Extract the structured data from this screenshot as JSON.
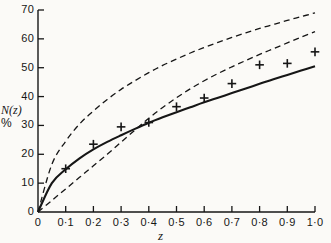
{
  "chart_data": {
    "type": "line",
    "title": "",
    "subtitle": "",
    "xlabel": "z",
    "ylabel": "N(z) %",
    "ylabel_lines": [
      "N(z)",
      "%"
    ],
    "xlim": [
      0,
      1.0
    ],
    "ylim": [
      0,
      70
    ],
    "grid": false,
    "legend": "none",
    "background_color": "#fbfaf7",
    "axis_color": "#161616",
    "x_ticks": [
      0,
      0.1,
      0.2,
      0.3,
      0.4,
      0.5,
      0.6,
      0.7,
      0.8,
      0.9,
      1.0
    ],
    "x_tick_labels": [
      "0",
      "0·1",
      "0·2",
      "0·3",
      "0·4",
      "0·5",
      "0·6",
      "0·7",
      "0·8",
      "0·9",
      "1·0"
    ],
    "y_ticks": [
      0,
      10,
      20,
      30,
      40,
      50,
      60,
      70
    ],
    "y_tick_labels": [
      "0",
      "10",
      "20",
      "30",
      "40",
      "50",
      "60",
      "70"
    ],
    "series": [
      {
        "name": "upper-dashed-curve",
        "style": "dashed",
        "color": "#161616",
        "x": [
          0,
          0.05,
          0.1,
          0.15,
          0.2,
          0.25,
          0.3,
          0.35,
          0.4,
          0.45,
          0.5,
          0.55,
          0.6,
          0.65,
          0.7,
          0.75,
          0.8,
          0.85,
          0.9,
          0.95,
          1.0
        ],
        "values": [
          0,
          16.5,
          24.5,
          30.5,
          35.0,
          39.0,
          42.5,
          45.5,
          48.3,
          50.8,
          53.0,
          55.1,
          57.0,
          58.8,
          60.5,
          62.1,
          63.6,
          65.0,
          66.4,
          67.7,
          69.0
        ]
      },
      {
        "name": "lower-dashed-curve",
        "style": "dashed",
        "color": "#161616",
        "x": [
          0,
          0.05,
          0.1,
          0.15,
          0.2,
          0.25,
          0.3,
          0.35,
          0.4,
          0.45,
          0.5,
          0.55,
          0.6,
          0.65,
          0.7,
          0.75,
          0.8,
          0.85,
          0.9,
          0.95,
          1.0
        ],
        "values": [
          0,
          4.0,
          8.0,
          12.0,
          16.0,
          20.0,
          24.2,
          28.4,
          32.5,
          36.2,
          39.6,
          42.7,
          45.5,
          48.0,
          50.3,
          52.5,
          54.6,
          56.6,
          58.6,
          60.6,
          62.5
        ]
      },
      {
        "name": "solid-curve",
        "style": "solid",
        "color": "#161616",
        "x": [
          0,
          0.05,
          0.1,
          0.15,
          0.2,
          0.25,
          0.3,
          0.35,
          0.4,
          0.45,
          0.5,
          0.55,
          0.6,
          0.65,
          0.7,
          0.75,
          0.8,
          0.85,
          0.9,
          0.95,
          1.0
        ],
        "values": [
          0,
          10.0,
          14.8,
          18.6,
          21.7,
          24.3,
          26.6,
          28.8,
          30.9,
          32.8,
          34.6,
          36.3,
          38.0,
          39.6,
          41.2,
          42.8,
          44.4,
          46.0,
          47.5,
          49.0,
          50.5
        ]
      }
    ],
    "points": {
      "name": "data-points",
      "marker": "plus",
      "color": "#161616",
      "x": [
        0.1,
        0.2,
        0.3,
        0.4,
        0.5,
        0.6,
        0.7,
        0.8,
        0.9,
        1.0
      ],
      "values": [
        15.0,
        23.5,
        29.5,
        31.0,
        36.5,
        39.5,
        44.5,
        51.0,
        51.5,
        55.5
      ]
    }
  }
}
